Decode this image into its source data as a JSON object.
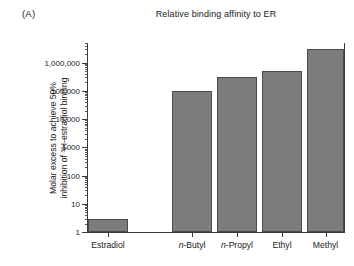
{
  "panel": {
    "label": "(A)"
  },
  "title": "Relative binding affinity to ER",
  "axis": {
    "ylabel_line1": "Molar excess to achieve 50%",
    "ylabel_line2_pre": "inhibition of ",
    "ylabel_line2_sup": "3",
    "ylabel_line2_post": "H-estradiol binding"
  },
  "chart_data": {
    "type": "bar",
    "title": "Relative binding affinity to ER",
    "xlabel": "",
    "ylabel": "Molar excess to achieve 50% inhibition of 3H-estradiol binding",
    "yscale": "log",
    "ylim": [
      1,
      5000000
    ],
    "grid": false,
    "legend": null,
    "categories": [
      "Estradiol",
      "n-Butyl",
      "n-Propyl",
      "Ethyl",
      "Methyl"
    ],
    "category_labels_html": [
      "Estradiol",
      "<i>n</i>-Butyl",
      "<i>n</i>-Propyl",
      "Ethyl",
      "Methyl"
    ],
    "values": [
      3,
      100000,
      300000,
      500000,
      3000000
    ],
    "bar_color": "#7c7c7c",
    "bar_edge_color": "#4a4a4a",
    "ytick_values": [
      1,
      10,
      100,
      1000,
      10000,
      100000,
      1000000
    ],
    "ytick_labels": [
      "1",
      "10",
      "100",
      "1000",
      "10,000",
      "100,000",
      "1,000,000"
    ]
  }
}
